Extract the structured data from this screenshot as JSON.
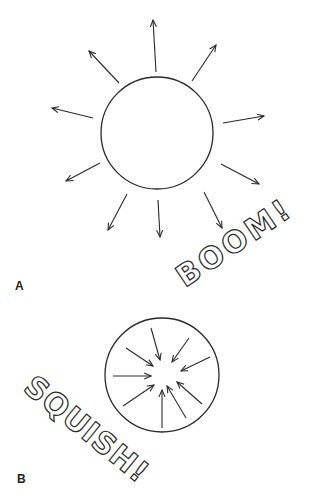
{
  "panels": [
    {
      "label": "A",
      "caption": "BOOM!",
      "description": "Circle with arrows radiating outward",
      "arrow_direction": "outward"
    },
    {
      "label": "B",
      "caption": "SQUISH!",
      "description": "Circle with arrows pointing inward toward center",
      "arrow_direction": "inward"
    }
  ],
  "colors": {
    "line": "#2a2a2a",
    "background": "#ffffff"
  }
}
